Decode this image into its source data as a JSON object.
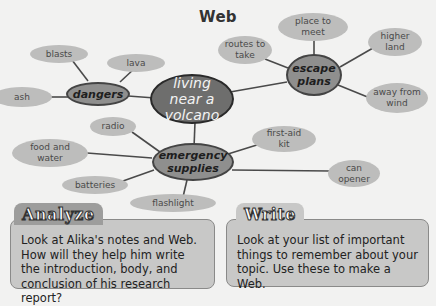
{
  "title": "Web",
  "web": {
    "center": "living near a volcano",
    "branches": {
      "dangers": {
        "label": "dangers",
        "items": [
          "blasts",
          "lava",
          "ash"
        ]
      },
      "escape": {
        "label": "escape plans",
        "items": [
          "place to meet",
          "routes to take",
          "higher land",
          "away from wind"
        ]
      },
      "supplies": {
        "label": "emergency supplies",
        "items": [
          "radio",
          "food and water",
          "batteries",
          "flashlight",
          "first-aid kit",
          "can opener"
        ]
      }
    }
  },
  "analyze": {
    "heading": "Analyze",
    "text": "Look at Alika's notes and Web. How will they help him write the introduction, body, and conclusion of his research report?"
  },
  "write": {
    "heading": "Write",
    "text": "Look at your list of important things to remember about your topic. Use these to make a Web."
  },
  "colors": {
    "background": "#f2f2f1",
    "leaf": "#bdbdbc",
    "branch": "#8f8f8e",
    "center": "#6e6e6d"
  }
}
